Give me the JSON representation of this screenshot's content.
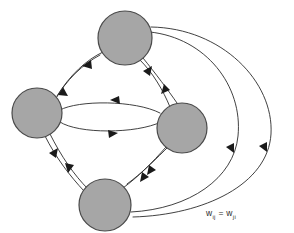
{
  "figure": {
    "kind": "recurrent-neural-network-graph",
    "background_color": "#ffffff",
    "node_fill_color": "#a6a6a6",
    "node_stroke_color": "#4a4a4a",
    "edge_color": "#2b2b2b",
    "arrow_color": "#1a1a1a"
  },
  "annotation": {
    "formula_text": "w",
    "formula_sub_left": "ij",
    "formula_equals": " = w",
    "formula_sub_right": "ji",
    "full_label": "wij = wji"
  },
  "nodes": [
    {
      "id": "top",
      "label": "",
      "cx": 125,
      "cy": 38,
      "r": 27
    },
    {
      "id": "left",
      "label": "",
      "cx": 37,
      "cy": 113,
      "r": 25
    },
    {
      "id": "right",
      "label": "",
      "cx": 182,
      "cy": 128,
      "r": 25
    },
    {
      "id": "bottom",
      "label": "",
      "cx": 105,
      "cy": 205,
      "r": 26
    }
  ],
  "edges": [
    {
      "from": "top",
      "to": "left",
      "direction": "bidirectional",
      "style": "curved-pair"
    },
    {
      "from": "top",
      "to": "right",
      "direction": "bidirectional",
      "style": "curved-pair"
    },
    {
      "from": "left",
      "to": "right",
      "direction": "bidirectional",
      "style": "lens-pair"
    },
    {
      "from": "left",
      "to": "bottom",
      "direction": "bidirectional",
      "style": "curved-pair"
    },
    {
      "from": "right",
      "to": "bottom",
      "direction": "bidirectional",
      "style": "curved-pair"
    },
    {
      "from": "top",
      "to": "bottom",
      "direction": "bidirectional",
      "style": "outer-sweep-pair"
    }
  ]
}
